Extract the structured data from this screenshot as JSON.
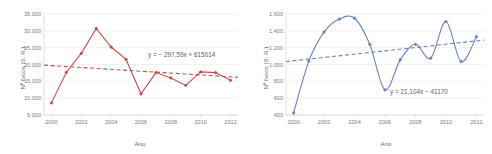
{
  "chart_data": [
    {
      "type": "line",
      "panel": "left",
      "title": "",
      "xlabel": "Ano",
      "ylabel": "Nº focos (S. R.)",
      "x": [
        2000,
        2001,
        2002,
        2003,
        2004,
        2005,
        2006,
        2007,
        2008,
        2009,
        2010,
        2011,
        2012
      ],
      "xtick_labels": [
        "2000",
        "2002",
        "2004",
        "2006",
        "2008",
        "2010",
        "2012"
      ],
      "xticks": [
        2000,
        2002,
        2004,
        2006,
        2008,
        2010,
        2012
      ],
      "values": [
        8600,
        17700,
        23300,
        30700,
        25200,
        21500,
        11300,
        17600,
        16000,
        13800,
        17800,
        17600,
        15300
      ],
      "ytick_labels": [
        "5.000",
        "10.000",
        "15.000",
        "20.000",
        "25.000",
        "30.000",
        "35.000"
      ],
      "yticks": [
        5000,
        10000,
        15000,
        20000,
        25000,
        30000,
        35000
      ],
      "ylim": [
        5000,
        35000
      ],
      "xlim": [
        1999.5,
        2012.5
      ],
      "trend": {
        "slope": -297.59,
        "intercept": 615014,
        "label": "y = − 297,59x + 615014",
        "y_start": 19800,
        "y_end": 16200
      },
      "grid": true,
      "legend": "none",
      "color": "#c0504d",
      "smooth": false
    },
    {
      "type": "line",
      "panel": "right",
      "title": "",
      "xlabel": "Ano",
      "ylabel": "Nº focos (S. R.)",
      "x": [
        2000,
        2001,
        2002,
        2003,
        2004,
        2005,
        2006,
        2007,
        2008,
        2009,
        2010,
        2011,
        2012
      ],
      "xtick_labels": [
        "2000",
        "2002",
        "2004",
        "2006",
        "2008",
        "2010",
        "2012"
      ],
      "xticks": [
        2000,
        2002,
        2004,
        2006,
        2008,
        2010,
        2012
      ],
      "values": [
        425,
        1040,
        1385,
        1540,
        1550,
        1240,
        700,
        1055,
        1240,
        1075,
        1510,
        1035,
        1330
      ],
      "ytick_labels": [
        "400",
        "600",
        "800",
        "1.000",
        "1.200",
        "1.400",
        "1.600"
      ],
      "yticks": [
        400,
        600,
        800,
        1000,
        1200,
        1400,
        1600
      ],
      "ylim": [
        400,
        1600
      ],
      "xlim": [
        1999.5,
        2012.5
      ],
      "trend": {
        "slope": 21.104,
        "intercept": -41170,
        "label": "y = 21,104x − 41170",
        "y_start": 1035,
        "y_end": 1290
      },
      "grid": true,
      "legend": "none",
      "color": "#6a7fc0",
      "smooth": true
    }
  ]
}
